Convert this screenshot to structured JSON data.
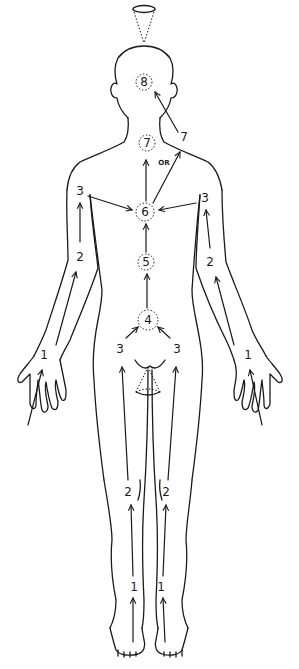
{
  "diagram": {
    "type": "body-energy-flow",
    "ink_color": "#1a1a1a",
    "background": "#ffffff",
    "centers": [
      {
        "id": "c8",
        "label": "8",
        "location": "crown of head"
      },
      {
        "id": "c7",
        "label": "7",
        "location": "throat"
      },
      {
        "id": "c6",
        "label": "6",
        "location": "chest / heart"
      },
      {
        "id": "c5",
        "label": "5",
        "location": "solar plexus"
      },
      {
        "id": "c4",
        "label": "4",
        "location": "lower abdomen"
      }
    ],
    "limb_points": {
      "left_arm": [
        "1",
        "2",
        "3"
      ],
      "right_arm": [
        "1",
        "2",
        "3"
      ],
      "left_leg": [
        "1",
        "2",
        "3"
      ],
      "right_leg": [
        "1",
        "2",
        "3"
      ]
    },
    "labels": {
      "c8": "8",
      "c7": "7",
      "c6": "6",
      "c5": "5",
      "c4": "4",
      "alt7": "7",
      "or": "OR",
      "l_arm_1": "1",
      "l_arm_2": "2",
      "l_arm_3": "3",
      "r_arm_1": "1",
      "r_arm_2": "2",
      "r_arm_3": "3",
      "l_hip_3": "3",
      "r_hip_3": "3",
      "l_knee_2": "2",
      "r_knee_2": "2",
      "l_ankle_1": "1",
      "r_ankle_1": "1"
    },
    "cones": [
      {
        "id": "crown-cone",
        "location": "above head",
        "orientation": "apex down"
      },
      {
        "id": "root-cone",
        "location": "groin",
        "orientation": "apex up"
      }
    ]
  }
}
